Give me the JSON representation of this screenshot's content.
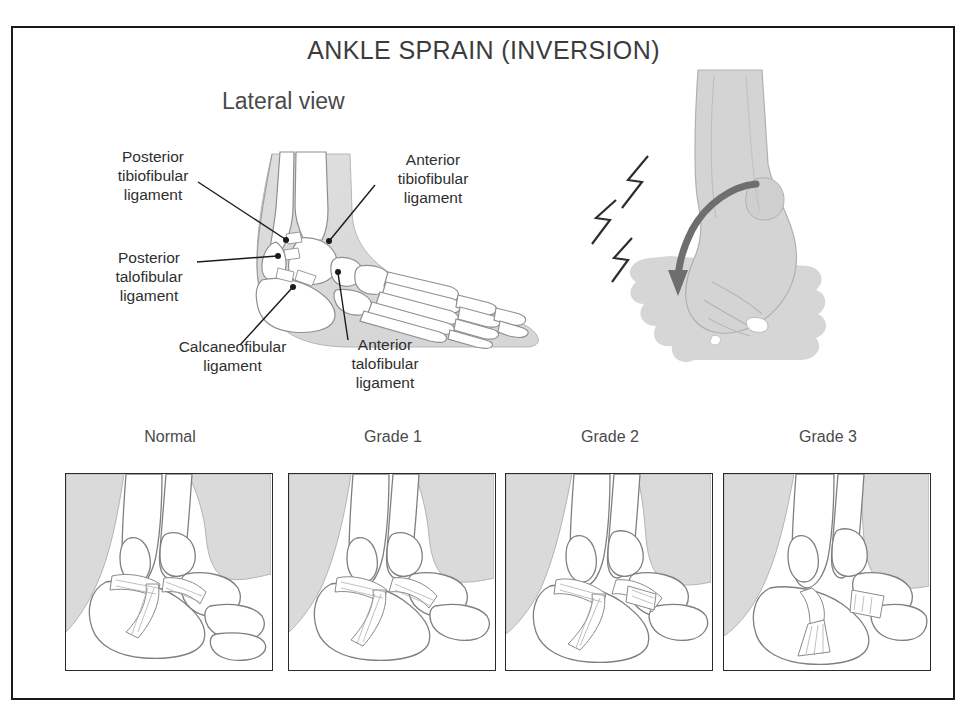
{
  "figure": {
    "title": "ANKLE SPRAIN (INVERSION)",
    "view_label": "Lateral view"
  },
  "annotations": [
    {
      "id": "posterior-tibiofibular-ligament",
      "text": "Posterior\ntibiofibular\nligament"
    },
    {
      "id": "anterior-tibiofibular-ligament",
      "text": "Anterior\ntibiofibular\nligament"
    },
    {
      "id": "posterior-talofibular-ligament",
      "text": "Posterior\ntalofibular\nligament"
    },
    {
      "id": "calcaneofibular-ligament",
      "text": "Calcaneofibular\nligament"
    },
    {
      "id": "anterior-talofibular-ligament",
      "text": "Anterior\ntalofibular\nligament"
    }
  ],
  "grades": [
    {
      "id": "normal",
      "caption": "Normal"
    },
    {
      "id": "grade-1",
      "caption": "Grade 1"
    },
    {
      "id": "grade-2",
      "caption": "Grade 2"
    },
    {
      "id": "grade-3",
      "caption": "Grade 3"
    }
  ],
  "colors": {
    "frame_border": "#1a1a1a",
    "soft_tissue_gray": "#dcdcdc",
    "bone_outline": "#8a8a8a",
    "text": "#3a3a3a",
    "leader_line": "#1b1b1b",
    "arrow_gray": "#7a7a7a",
    "shadow_gray": "#cccccc"
  }
}
